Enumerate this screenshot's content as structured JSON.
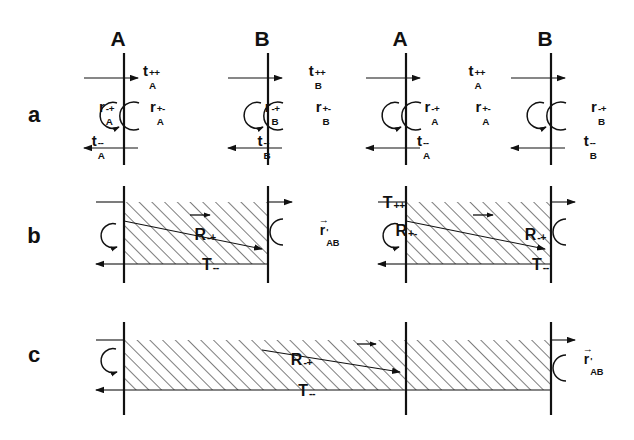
{
  "figure": {
    "type": "scientific-diagram",
    "caption_rows": [
      "a",
      "b",
      "c"
    ],
    "background": "#ffffff",
    "ink": "#111111",
    "hatch_angle_deg": 45,
    "hatch_spacing_px": 9
  },
  "column_headers": [
    {
      "label": "A",
      "x": 118,
      "y": 42
    },
    {
      "label": "B",
      "x": 262,
      "y": 42
    },
    {
      "label": "A",
      "x": 400,
      "y": 42
    },
    {
      "label": "B",
      "x": 545,
      "y": 42
    }
  ],
  "row_labels": [
    {
      "label": "a",
      "x": 34,
      "y": 118
    },
    {
      "label": "b",
      "x": 34,
      "y": 239
    },
    {
      "label": "c",
      "x": 34,
      "y": 358
    }
  ],
  "row_a": {
    "interfaces": [
      {
        "name": "interface-A-1",
        "x": 124,
        "t_plus_plus": {
          "base": "t",
          "sub": "A",
          "sup": "++"
        },
        "t_minus_minus": {
          "base": "t",
          "sub": "A",
          "sup": "--"
        },
        "r_minus_plus": {
          "base": "r",
          "sub": "A",
          "sup": "-+"
        },
        "r_plus_minus": {
          "base": "r",
          "sub": "A",
          "sup": "+-"
        }
      },
      {
        "name": "interface-B-1",
        "x": 268,
        "t_plus_plus": {
          "base": "t",
          "sub": "B",
          "sup": "++"
        },
        "t_minus_minus": {
          "base": "t",
          "sub": "B",
          "sup": "--"
        },
        "r_minus_plus": {
          "base": "r",
          "sub": "B",
          "sup": "-+"
        },
        "r_plus_minus": {
          "base": "r",
          "sub": "B",
          "sup": "+-"
        }
      },
      {
        "name": "interface-A-2",
        "x": 406,
        "t_plus_plus": {
          "base": "t",
          "sub": "A",
          "sup": "++"
        },
        "t_minus_minus": {
          "base": "t",
          "sub": "A",
          "sup": "--"
        },
        "r_minus_plus": {
          "base": "r",
          "sub": "A",
          "sup": "-+"
        },
        "r_plus_minus": {
          "base": "r",
          "sub": "A",
          "sup": "+-"
        }
      },
      {
        "name": "interface-B-2",
        "x": 551,
        "t_plus_plus": {
          "base": "t",
          "sub": "B",
          "sup": "++"
        },
        "t_minus_minus": {
          "base": "t",
          "sub": "B",
          "sup": "--"
        },
        "r_minus_plus": {
          "base": "r",
          "sub": "B",
          "sup": "-+"
        },
        "r_plus_minus": {
          "base": "r",
          "sub": "B",
          "sup": "+-"
        }
      }
    ]
  },
  "row_b": {
    "blocks": [
      {
        "name": "slab-1",
        "left_x": 124,
        "right_x": 268,
        "labels": {
          "T_plus_plus": {
            "base": "T",
            "sup": "++"
          },
          "T_minus_minus": {
            "base": "T",
            "sup": "--"
          },
          "R_minus_plus": {
            "base": "R",
            "sup": "-+"
          },
          "R_plus_minus": {
            "base": "R",
            "sup": "+-"
          },
          "ray": {
            "base": "r",
            "sub": "AB",
            "sup": "'",
            "vector": true
          }
        }
      },
      {
        "name": "slab-2",
        "left_x": 406,
        "right_x": 551,
        "labels": {
          "T_plus_plus": {
            "base": "T",
            "sup": "++"
          },
          "T_minus_minus": {
            "base": "T",
            "sup": "--"
          },
          "R_minus_plus": {
            "base": "R",
            "sup": "-+"
          },
          "R_plus_minus": {
            "base": "R",
            "sup": "+-"
          },
          "ray": {
            "base": "r",
            "sub": "AB",
            "sup": "'",
            "vector": true
          }
        }
      }
    ]
  },
  "row_c": {
    "block": {
      "name": "slab-wide",
      "left_x": 124,
      "right_x": 551,
      "mid_x": 406,
      "labels": {
        "T_plus_plus": {
          "base": "T",
          "sup": "++"
        },
        "T_minus_minus": {
          "base": "T",
          "sup": "--"
        },
        "R_minus_plus": {
          "base": "R",
          "sup": "-+"
        },
        "R_plus_minus": {
          "base": "R",
          "sup": "+-"
        },
        "ray": {
          "base": "r",
          "sub": "AB",
          "sup": "'",
          "vector": true
        }
      }
    }
  }
}
